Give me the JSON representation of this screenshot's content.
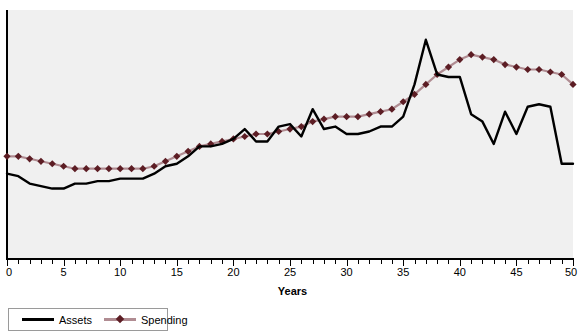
{
  "chart_data": {
    "type": "line",
    "title": "",
    "xlabel": "Years",
    "ylabel": "",
    "xlim": [
      0,
      50
    ],
    "ylim": [
      0,
      100
    ],
    "grid": false,
    "legend_position": "below-left",
    "xticks": [
      0,
      5,
      10,
      15,
      20,
      25,
      30,
      35,
      40,
      45,
      50
    ],
    "xtick_labels": [
      "0",
      "5",
      "10",
      "15",
      "20",
      "25",
      "30",
      "35",
      "40",
      "45",
      "50"
    ],
    "minor_tick_interval": 1,
    "x": [
      0,
      1,
      2,
      3,
      4,
      5,
      6,
      7,
      8,
      9,
      10,
      11,
      12,
      13,
      14,
      15,
      16,
      17,
      18,
      19,
      20,
      21,
      22,
      23,
      24,
      25,
      26,
      27,
      28,
      29,
      30,
      31,
      32,
      33,
      34,
      35,
      36,
      37,
      38,
      39,
      40,
      41,
      42,
      43,
      44,
      45,
      46,
      47,
      48,
      49,
      50
    ],
    "series": [
      {
        "name": "Assets",
        "color": "#000000",
        "marker": "none",
        "values": [
          34,
          33,
          30,
          29,
          28,
          28,
          30,
          30,
          31,
          31,
          32,
          32,
          32,
          34,
          37,
          38,
          41,
          45,
          45,
          46,
          48,
          52,
          47,
          47,
          53,
          54,
          49,
          60,
          52,
          53,
          50,
          50,
          51,
          53,
          53,
          57,
          70,
          88,
          74,
          73,
          73,
          58,
          55,
          46,
          59,
          50,
          61,
          62,
          61,
          38,
          38
        ]
      },
      {
        "name": "Spending",
        "color": "#b08c92",
        "marker": "diamond",
        "marker_color": "#5c1d24",
        "values": [
          41,
          41,
          40,
          39,
          38,
          37,
          36,
          36,
          36,
          36,
          36,
          36,
          36,
          37,
          39,
          41,
          43,
          45,
          46,
          47,
          48,
          49,
          50,
          50,
          51,
          52,
          53,
          55,
          56,
          57,
          57,
          57,
          58,
          59,
          60,
          63,
          66,
          70,
          74,
          77,
          80,
          82,
          81,
          80,
          78,
          77,
          76,
          76,
          75,
          74,
          70
        ]
      }
    ]
  },
  "legend": {
    "items": [
      {
        "label": "Assets"
      },
      {
        "label": "Spending"
      }
    ]
  },
  "colors": {
    "assets_line": "#000000",
    "spending_line": "#b08c92",
    "spending_marker": "#5c1d24",
    "plot_background": "#f0f0f0",
    "axis": "#000000"
  }
}
